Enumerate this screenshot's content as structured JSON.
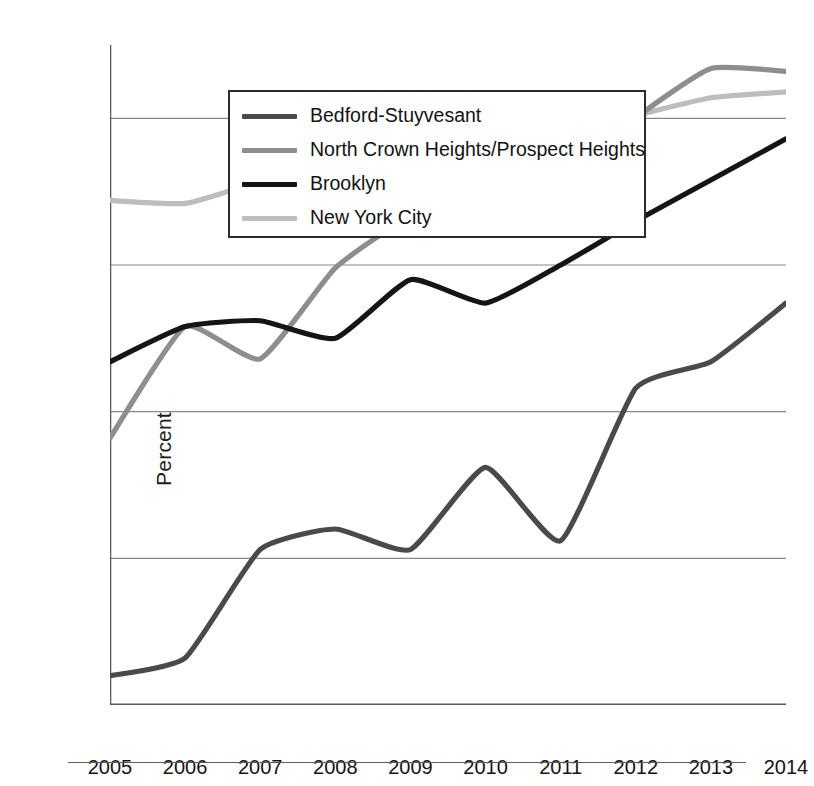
{
  "chart_data": {
    "type": "line",
    "title": "",
    "xlabel": "",
    "ylabel": "Percent",
    "x": [
      2005,
      2006,
      2007,
      2008,
      2009,
      2010,
      2011,
      2012,
      2013,
      2014
    ],
    "xtick_labels": [
      "2005",
      "2006",
      "2007",
      "2008",
      "2009",
      "2010",
      "2011",
      "2012",
      "2013",
      "2014"
    ],
    "ytick_labels": [
      "15",
      "20",
      "25",
      "30",
      "35"
    ],
    "yticks": [
      15,
      20,
      25,
      30,
      35
    ],
    "ylim": [
      15,
      37.5
    ],
    "xlim": [
      2005,
      2014
    ],
    "grid": "horizontal",
    "legend_position": "top-left",
    "series": [
      {
        "name": "Bedford-Stuyvesant",
        "color": "#4a4a4a",
        "values": [
          16.0,
          16.6,
          20.3,
          21.0,
          20.3,
          23.1,
          20.6,
          25.8,
          26.7,
          28.7
        ]
      },
      {
        "name": "North Crown Heights/Prospect Heights",
        "color": "#8e8e8e",
        "values": [
          24.1,
          27.9,
          26.8,
          29.9,
          31.7,
          33.1,
          32.5,
          35.0,
          36.7,
          36.6
        ]
      },
      {
        "name": "Brooklyn",
        "color": "#151515",
        "values": [
          26.7,
          27.9,
          28.1,
          27.5,
          29.5,
          28.7,
          30.0,
          31.5,
          32.9,
          34.3
        ]
      },
      {
        "name": "New York City",
        "color": "#bdbdbd",
        "values": [
          32.2,
          32.1,
          32.8,
          32.7,
          33.9,
          33.4,
          34.5,
          35.1,
          35.7,
          35.9
        ]
      }
    ]
  },
  "axes": {
    "y_title": "Percent"
  },
  "legend": {
    "entries": [
      {
        "label": "Bedford-Stuyvesant",
        "color": "#4a4a4a",
        "weight": 5
      },
      {
        "label": "North Crown Heights/Prospect Heights",
        "color": "#8e8e8e",
        "weight": 5
      },
      {
        "label": "Brooklyn",
        "color": "#151515",
        "weight": 5
      },
      {
        "label": "New York City",
        "color": "#bdbdbd",
        "weight": 5
      }
    ]
  },
  "colors": {
    "gridline": "#888888",
    "axis": "#5a5a5a",
    "legend_border": "#2b2b2b",
    "background": "#ffffff"
  }
}
